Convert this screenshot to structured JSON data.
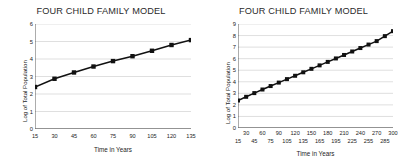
{
  "chart_data": [
    {
      "type": "line",
      "title": "FOUR CHILD FAMILY MODEL",
      "xlabel": "Time in Years",
      "ylabel": "Log of Total Population",
      "xticklabels": [
        "15",
        "30",
        "45",
        "60",
        "75",
        "90",
        "105",
        "120",
        "135"
      ],
      "xtickvalues": [
        15,
        30,
        45,
        60,
        75,
        90,
        105,
        120,
        135
      ],
      "yticklabels": [
        "0",
        "1",
        "2",
        "3",
        "4",
        "5",
        "6"
      ],
      "ytickvalues": [
        0,
        1,
        2,
        3,
        4,
        5,
        6
      ],
      "xlim": [
        15,
        135
      ],
      "ylim": [
        0,
        6
      ],
      "grid": true,
      "legend": "none",
      "marker": "square",
      "series_color": "#111111",
      "x": [
        15,
        30,
        45,
        60,
        75,
        90,
        105,
        120,
        135
      ],
      "values": [
        2.4,
        2.87,
        3.23,
        3.57,
        3.88,
        4.16,
        4.47,
        4.8,
        5.08
      ]
    },
    {
      "type": "line",
      "title": "FOUR CHILD FAMILY MODEL",
      "xlabel": "Time in Years",
      "ylabel": "Log of Total Population",
      "xticklabels_top": [
        "30",
        "60",
        "90",
        "120",
        "150",
        "180",
        "210",
        "240",
        "270",
        "300"
      ],
      "xticklabels_bottom": [
        "15",
        "45",
        "75",
        "105",
        "135",
        "165",
        "195",
        "225",
        "255",
        "285"
      ],
      "xtickvalues_top": [
        30,
        60,
        90,
        120,
        150,
        180,
        210,
        240,
        270,
        300
      ],
      "xtickvalues_bottom": [
        15,
        45,
        75,
        105,
        135,
        165,
        195,
        225,
        255,
        285
      ],
      "yticklabels": [
        "0",
        "1",
        "2",
        "3",
        "4",
        "5",
        "6",
        "7",
        "8",
        "9"
      ],
      "ytickvalues": [
        0,
        1,
        2,
        3,
        4,
        5,
        6,
        7,
        8,
        9
      ],
      "xlim": [
        15,
        300
      ],
      "ylim": [
        0,
        9
      ],
      "grid": true,
      "legend": "none",
      "marker": "square",
      "series_color": "#111111",
      "x": [
        15,
        30,
        45,
        60,
        75,
        90,
        105,
        120,
        135,
        150,
        165,
        180,
        195,
        210,
        225,
        240,
        255,
        270,
        285,
        300
      ],
      "values": [
        2.38,
        2.7,
        3.02,
        3.33,
        3.63,
        3.93,
        4.23,
        4.52,
        4.82,
        5.12,
        5.42,
        5.72,
        6.02,
        6.32,
        6.62,
        6.92,
        7.22,
        7.52,
        7.95,
        8.38
      ]
    }
  ]
}
